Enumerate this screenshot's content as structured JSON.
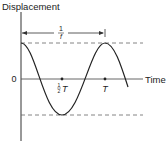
{
  "diagram": {
    "y_axis_label": "Displacement",
    "x_axis_label": "Time",
    "origin_label": "0",
    "period_arrow_label": {
      "numerator": "1",
      "denominator": "f"
    },
    "half_period_label": {
      "numerator": "1",
      "denominator": "2",
      "symbol": "T"
    },
    "period_label": "T",
    "colors": {
      "ink": "#222222",
      "dashed": "#666666",
      "background": "#ffffff"
    }
  }
}
